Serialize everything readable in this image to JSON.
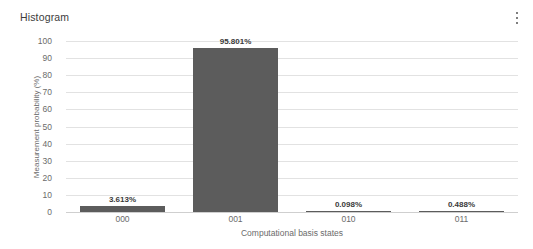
{
  "header": {
    "title": "Histogram",
    "menu_icon": "more-vertical-icon"
  },
  "chart_data": {
    "type": "bar",
    "title": "Histogram",
    "xlabel": "Computational basis states",
    "ylabel": "Measurement probability (%)",
    "categories": [
      "000",
      "001",
      "010",
      "011"
    ],
    "values": [
      3.613,
      95.801,
      0.098,
      0.488
    ],
    "value_labels": [
      "3.613%",
      "95.801%",
      "0.098%",
      "0.488%"
    ],
    "ylim": [
      0,
      100
    ],
    "yticks": [
      100,
      90,
      80,
      70,
      60,
      50,
      40,
      30,
      20,
      10,
      0
    ],
    "ytick_labels": [
      "100",
      "90",
      "80",
      "70",
      "60",
      "50",
      "40",
      "30",
      "20",
      "10",
      "0"
    ],
    "grid": true,
    "legend": false,
    "bar_color": "#5c5c5c",
    "grid_color": "#e2e2e2",
    "axis_color": "#cfcfcf",
    "text_color": "#6b6b6b"
  }
}
